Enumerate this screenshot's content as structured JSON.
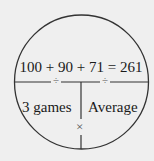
{
  "diagram": {
    "type": "average-pie",
    "equation": "100 + 90 + 71 = 261",
    "bottom_left_label": "3 games",
    "bottom_right_label": "Average",
    "divide_symbol_left": "÷",
    "divide_symbol_right": "÷",
    "multiply_symbol": "×",
    "colors": {
      "background": "#efefef",
      "stroke": "#333333",
      "text": "#1a1a1a"
    }
  }
}
